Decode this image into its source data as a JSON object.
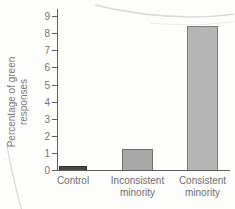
{
  "page": {
    "background": "#fdfdfc"
  },
  "decoration": {
    "curl_color_top": "#d9d9d9",
    "curl_color_faint": "#ececec",
    "curl_color_bottom": "#dcdcdc"
  },
  "chart_data": {
    "type": "bar",
    "title": "",
    "xlabel": "",
    "ylabel": "Percentage of green responses",
    "ylabel_lines": [
      "Percentage of green",
      "responses"
    ],
    "categories": [
      "Control",
      "Inconsistent minority",
      "Consistent minority"
    ],
    "category_lines": [
      [
        "Control"
      ],
      [
        "Inconsistent",
        "minority"
      ],
      [
        "Consistent",
        "minority"
      ]
    ],
    "values": [
      0.25,
      1.25,
      8.42
    ],
    "ylim": [
      0,
      9
    ],
    "yticks": [
      0,
      1,
      2,
      3,
      4,
      5,
      6,
      7,
      8,
      9
    ],
    "grid": false,
    "legend": null,
    "bar_fill_colors": [
      "#474747",
      "#a8a8a8",
      "#b5b5b5"
    ],
    "bar_border_colors": [
      "#2f2f2f",
      "#6f6f6f",
      "#7a7a7a"
    ],
    "axis_color": "#5f5f5f",
    "tick_label_color": "#757575",
    "category_label_color": "#6e6e6e"
  }
}
